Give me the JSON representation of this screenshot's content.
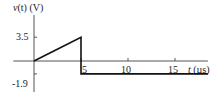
{
  "chart_data": {
    "type": "line",
    "title": "",
    "ylabel": "v(t) (V)",
    "ylabel_parts": {
      "var": "v",
      "arg": "(t)",
      "unit": " (V)"
    },
    "xlabel": "t (µs)",
    "xlabel_parts": {
      "var": "t",
      "unit": " (µs)"
    },
    "xticks": [
      5,
      10,
      15
    ],
    "xtick_labels": [
      "5",
      "10",
      "15"
    ],
    "yticks": [
      3.5,
      -1.9
    ],
    "ytick_labels": [
      "3.5",
      "-1.9"
    ],
    "xlim": [
      -2.2,
      18.5
    ],
    "ylim": [
      -2.9,
      5.0
    ],
    "grid": false,
    "legend": null,
    "series": [
      {
        "name": "v(t)",
        "x": [
          0,
          5,
          5,
          18.5
        ],
        "y": [
          0,
          3.5,
          -1.9,
          -1.9
        ]
      }
    ],
    "annotations": [
      {
        "text": "5",
        "x": 5,
        "y": 0,
        "note": "tick label placed just right of the vertical drop, below axis"
      }
    ]
  },
  "colors": {
    "axis": "#555555",
    "line": "#111111",
    "text": "#222222",
    "background": "#ffffff"
  }
}
